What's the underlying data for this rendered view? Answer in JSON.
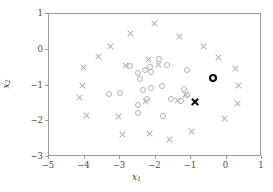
{
  "chart_data": {
    "type": "scatter",
    "title": "",
    "xlabel": "x1",
    "ylabel": "x2",
    "xlim": [
      -5,
      1
    ],
    "ylim": [
      -3,
      1
    ],
    "grid": false,
    "legend": "none",
    "xticks": [
      -5,
      -4,
      -3,
      -2,
      -1,
      0,
      1
    ],
    "xticklabels": [
      "−5",
      "−4",
      "−3",
      "−2",
      "−1",
      "0",
      "1"
    ],
    "yticks": [
      -3,
      -2,
      -1,
      0,
      1
    ],
    "yticklabels": [
      "−3",
      "−2",
      "−1",
      "0",
      "1"
    ],
    "colors": {
      "class_x": "#b0b0b0",
      "class_o": "#b0b0b0",
      "highlight": "#000000",
      "axis": "#9a9a9a",
      "background": "#ffffff"
    },
    "series": [
      {
        "name": "class-x",
        "marker": "x",
        "color": "#b0b0b0",
        "emphasis": false,
        "points": [
          [
            -2.68,
            0.44
          ],
          [
            -2.0,
            0.72
          ],
          [
            -3.25,
            0.05
          ],
          [
            -1.29,
            0.34
          ],
          [
            -3.58,
            -0.22
          ],
          [
            -0.62,
            0.05
          ],
          [
            -3.99,
            -0.53
          ],
          [
            -0.19,
            -0.24
          ],
          [
            0.28,
            -0.54
          ],
          [
            -4.02,
            -1.02
          ],
          [
            0.36,
            -1.04
          ],
          [
            -4.1,
            -1.37
          ],
          [
            -3.92,
            -1.87
          ],
          [
            -3.01,
            -1.89
          ],
          [
            -2.9,
            -2.39
          ],
          [
            -2.15,
            -2.36
          ],
          [
            -1.58,
            -2.54
          ],
          [
            -0.96,
            -2.32
          ],
          [
            0.33,
            -1.52
          ],
          [
            -0.04,
            -1.94
          ],
          [
            -1.34,
            -1.44
          ],
          [
            -2.25,
            -1.47
          ],
          [
            -1.13,
            -1.27
          ],
          [
            -1.9,
            -0.43
          ],
          [
            -2.17,
            -0.31
          ],
          [
            -2.83,
            -0.47
          ]
        ]
      },
      {
        "name": "class-o",
        "marker": "o",
        "color": "#b0b0b0",
        "emphasis": false,
        "points": [
          [
            -2.69,
            -0.48
          ],
          [
            -2.28,
            -0.6
          ],
          [
            -2.46,
            -0.68
          ],
          [
            -2.42,
            -0.84
          ],
          [
            -2.12,
            -0.52
          ],
          [
            -2.09,
            -0.65
          ],
          [
            -1.64,
            -0.46
          ],
          [
            -1.87,
            -0.3
          ],
          [
            -1.08,
            -0.59
          ],
          [
            -3.27,
            -1.26
          ],
          [
            -2.96,
            -1.25
          ],
          [
            -2.11,
            -1.09
          ],
          [
            -1.79,
            -1.04
          ],
          [
            -1.18,
            -1.13
          ],
          [
            -1.09,
            -1.29
          ],
          [
            -2.47,
            -1.58
          ],
          [
            -2.47,
            -1.8
          ],
          [
            -1.76,
            -1.88
          ],
          [
            -2.22,
            -1.41
          ],
          [
            -1.53,
            -1.41
          ],
          [
            -2.32,
            -1.14
          ],
          [
            -1.24,
            -1.47
          ]
        ]
      },
      {
        "name": "query-o",
        "marker": "o",
        "color": "#000000",
        "emphasis": true,
        "points": [
          [
            -0.35,
            -0.82
          ]
        ]
      },
      {
        "name": "query-x",
        "marker": "x",
        "color": "#000000",
        "emphasis": true,
        "points": [
          [
            -0.86,
            -1.49
          ]
        ]
      }
    ]
  }
}
